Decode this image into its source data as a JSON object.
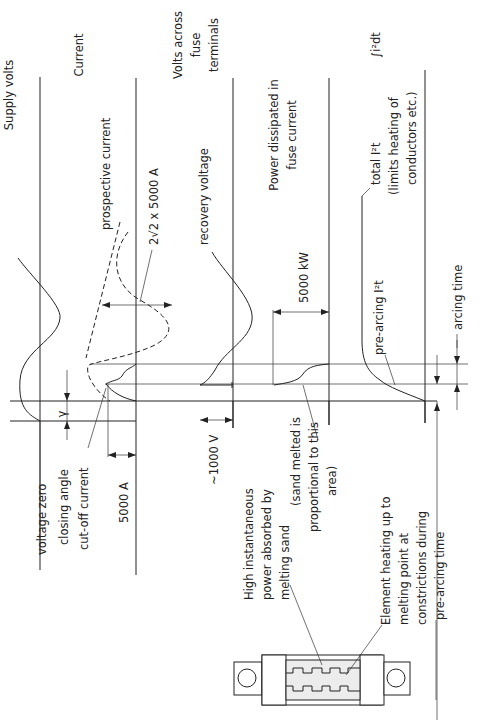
{
  "diagram": {
    "orientation": "rotated-90-ccw",
    "traces": [
      {
        "id": "supply-volts",
        "label": "Supply volts"
      },
      {
        "id": "current",
        "label": "Current"
      },
      {
        "id": "volts-across-fuse",
        "label_lines": [
          "Volts across",
          "fuse",
          "terminals"
        ]
      },
      {
        "id": "power",
        "label_lines": [
          "Power dissipated in",
          "fuse current"
        ]
      },
      {
        "id": "i2t",
        "label": "∫i²dt"
      }
    ],
    "annotations": {
      "voltage_zero": "voltage zero",
      "closing_angle": "closing angle",
      "gamma": "γ",
      "cut_off_current": "cut-off current",
      "five_thousand_a": "5000 A",
      "prospective_current": "prospective current",
      "peak_prospective": "2√2 x 5000 A",
      "recovery_voltage": "recovery voltage",
      "approx_1000v": "~1000 V",
      "five_thousand_kw": "5000 kW",
      "sand_note_lines": [
        "(sand melted is",
        "proportional to this",
        "area)"
      ],
      "total_i2t": "total  I²t",
      "total_i2t_note_lines": [
        "(limits heating of",
        "conductors etc.)"
      ],
      "pre_arcing_i2t": "pre-arcing  I²t",
      "arcing_time": "arcing time",
      "high_power_lines": [
        "High instantaneous",
        "power absorbed by",
        "melting sand"
      ],
      "element_heating_lines": [
        "Element heating up to",
        "melting point at",
        "constrictions during",
        "pre-arcing time"
      ]
    },
    "colors": {
      "ink": "#222222",
      "background": "#ffffff",
      "sand_fill": "#ececec"
    }
  }
}
